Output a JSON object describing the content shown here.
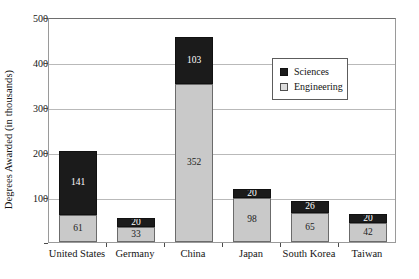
{
  "chart_data": {
    "type": "bar",
    "stacked": true,
    "title": "",
    "xlabel": "",
    "ylabel": "Degrees Awarded (in thousands)",
    "ylim": [
      0,
      500
    ],
    "yticks": [
      0,
      100,
      200,
      300,
      400,
      500
    ],
    "ytick_labels": [
      "",
      "100",
      "200",
      "300",
      "400",
      "500"
    ],
    "grid": "horizontal",
    "legend_position": "upper-right",
    "categories": [
      "United States",
      "Germany",
      "China",
      "Japan",
      "South Korea",
      "Taiwan"
    ],
    "series": [
      {
        "name": "Engineering",
        "color": "#c9c9c9",
        "values": [
          61,
          33,
          352,
          98,
          65,
          42
        ]
      },
      {
        "name": "Sciences",
        "color": "#1b1b1b",
        "values": [
          141,
          20,
          103,
          20,
          26,
          20
        ]
      }
    ],
    "totals": [
      202,
      53,
      455,
      118,
      91,
      62
    ]
  },
  "legend": {
    "entries": [
      {
        "label": "Sciences",
        "swatch": "sciences"
      },
      {
        "label": "Engineering",
        "swatch": "engineering"
      }
    ]
  }
}
